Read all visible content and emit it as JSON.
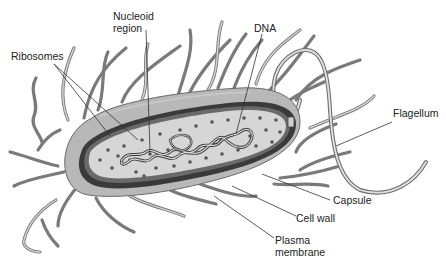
{
  "diagram": {
    "labels": {
      "nucleoid_line1": "Nucleoid",
      "nucleoid_line2": "region",
      "ribosomes": "Ribosomes",
      "dna": "DNA",
      "flagellum": "Flagellum",
      "capsule": "Capsule",
      "cell_wall": "Cell wall",
      "plasma_line1": "Plasma",
      "plasma_line2": "membrane"
    },
    "colors": {
      "capsule_fill": "#b8b8b8",
      "cell_wall": "#3a3a3a",
      "membrane": "#5a5a5a",
      "cytoplasm": "#d6d6d6",
      "ribosome": "#555555",
      "pili": "#7a7a7a",
      "text": "#222222"
    }
  }
}
